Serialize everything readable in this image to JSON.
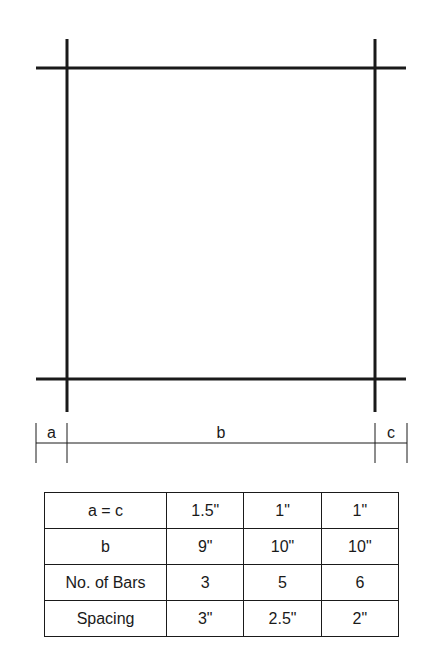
{
  "diagram": {
    "title": "",
    "dimension_labels": {
      "left": "a",
      "middle": "b",
      "right": "c"
    }
  },
  "table": {
    "rows": [
      {
        "label": "a = c",
        "values": [
          "1.5\"",
          "1\"",
          "1\""
        ]
      },
      {
        "label": "b",
        "values": [
          "9\"",
          "10\"",
          "10\""
        ]
      },
      {
        "label": "No. of Bars",
        "values": [
          "3",
          "5",
          "6"
        ]
      },
      {
        "label": "Spacing",
        "values": [
          "3\"",
          "2.5\"",
          "2\""
        ]
      }
    ]
  },
  "colors": {
    "line": "#1a1a1a",
    "background": "#ffffff"
  }
}
